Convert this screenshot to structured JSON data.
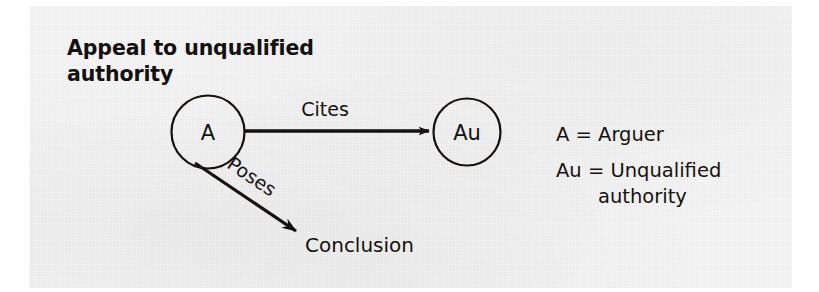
{
  "figure": {
    "title_line_1": "Appeal to unqualified",
    "title_line_2": "authority",
    "nodes": [
      {
        "id": "A",
        "label": "A"
      },
      {
        "id": "Au",
        "label": "Au"
      }
    ],
    "edges": [
      {
        "from": "A",
        "to": "Au",
        "label": "Cites"
      },
      {
        "from": "A",
        "to": "Conclusion",
        "label": "Poses"
      }
    ],
    "terminal_label": "Conclusion",
    "legend": [
      {
        "key": "A",
        "equals": "=",
        "value": "Arguer",
        "value_wrap": ""
      },
      {
        "key": "Au",
        "equals": "=",
        "value": "Unqualified",
        "value_wrap": "authority"
      }
    ],
    "colors": {
      "ink": "#15110f",
      "paper": "#f4f4f4",
      "margin": "#ffffff"
    }
  }
}
